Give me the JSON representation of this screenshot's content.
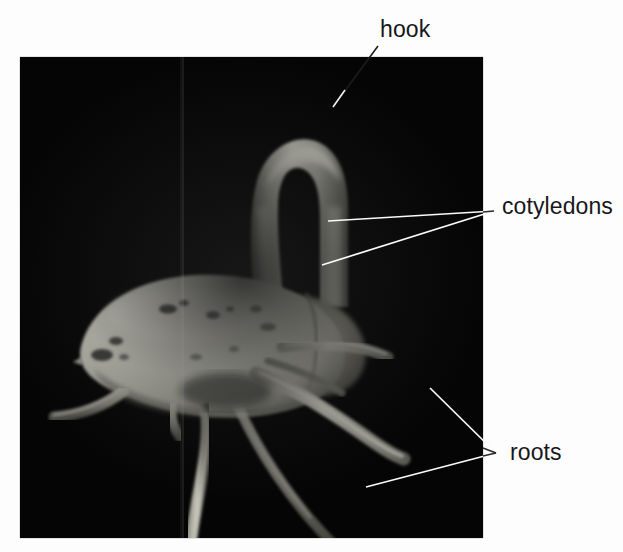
{
  "figure": {
    "background_color": "#ffffff",
    "photo": {
      "background_color": "#050505",
      "x": 20,
      "y": 57,
      "width": 463,
      "height": 481,
      "artifact": "vertical-scan-seam"
    },
    "leader_line_color": "#ffffff",
    "text_color": "#17171a"
  },
  "labels": [
    {
      "id": "hook",
      "text": "hook",
      "target": "curved tip of the hypocotyl arch",
      "leader": {
        "from_x": 378,
        "from_y": 46,
        "to_x": 333,
        "to_y": 107
      }
    },
    {
      "id": "cotyledons",
      "text": "cotyledons",
      "target": "pair of pale seed-leaves forming the seed body",
      "leader_count": 2,
      "leader_converge_x": 494,
      "leader_converge_y": 211,
      "leaders": [
        {
          "to_x": 328,
          "to_y": 221
        },
        {
          "to_x": 322,
          "to_y": 265
        }
      ]
    },
    {
      "id": "roots",
      "text": "roots",
      "target": "lateral and primary roots emerging below the seed",
      "leader_count": 2,
      "leader_converge_x": 496,
      "leader_converge_y": 453,
      "leaders": [
        {
          "to_x": 430,
          "to_y": 388
        },
        {
          "to_x": 366,
          "to_y": 487
        }
      ]
    }
  ],
  "specimen_parts": {
    "hook_color": "#b9b9b0",
    "cotyledon_color": "#e6e4d8",
    "root_color": "#8e8d84",
    "spot_color": "#2b2b28"
  }
}
